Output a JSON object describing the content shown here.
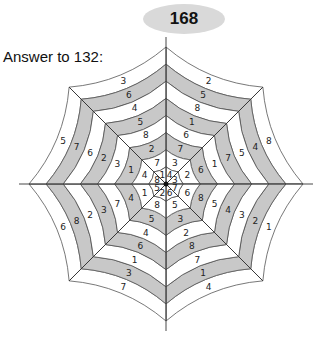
{
  "page": {
    "number": "168"
  },
  "answer_label": "Answer to 132:",
  "colors": {
    "band_gray": "#c8c8c8",
    "band_white": "#ffffff",
    "line": "#555555"
  },
  "puzzle": {
    "type": "spider-web",
    "spokes": 8,
    "rings": 8,
    "center": [
      166,
      184
    ],
    "sectors_center_to_outer": [
      {
        "name": "top-right",
        "values": [
          4,
          3,
          7,
          6,
          1,
          8,
          5,
          2
        ]
      },
      {
        "name": "right-upper",
        "values": [
          3,
          2,
          6,
          1,
          7,
          5,
          4,
          8
        ]
      },
      {
        "name": "right-lower",
        "values": [
          7,
          6,
          8,
          5,
          4,
          3,
          2,
          1
        ]
      },
      {
        "name": "bottom-right",
        "values": [
          6,
          5,
          3,
          2,
          8,
          7,
          1,
          4
        ]
      },
      {
        "name": "bottom-left",
        "values": [
          2,
          8,
          5,
          4,
          6,
          1,
          3,
          7
        ]
      },
      {
        "name": "left-lower",
        "values": [
          5,
          1,
          4,
          7,
          3,
          2,
          8,
          6
        ]
      },
      {
        "name": "left-upper",
        "values": [
          8,
          4,
          1,
          3,
          2,
          6,
          7,
          5
        ]
      },
      {
        "name": "top-left",
        "values": [
          1,
          7,
          2,
          8,
          5,
          4,
          6,
          3
        ]
      }
    ]
  }
}
